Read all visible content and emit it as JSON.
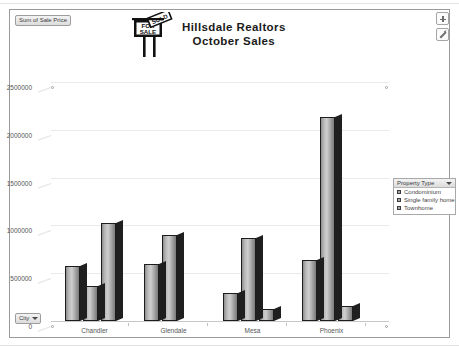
{
  "workbook": {
    "value_field_button": "Sum of Sale Price",
    "city_field_button": "City"
  },
  "chart": {
    "title_line1": "Hillsdale Realtors",
    "title_line2": "October Sales",
    "logo_for": "FOR",
    "logo_sale": "SALE",
    "logo_sold": "SOLD"
  },
  "legend": {
    "header": "Property Type",
    "items": [
      {
        "label": "Condominium",
        "color": "#a9a9a9"
      },
      {
        "label": "Single family home",
        "color": "#a9a9a9"
      },
      {
        "label": "Townhome",
        "color": "#a9a9a9"
      }
    ]
  },
  "tools": {
    "add_label": "+",
    "edit_label": "edit"
  },
  "chart_data": {
    "type": "bar",
    "title": "Hillsdale Realtors October Sales",
    "xlabel": "City",
    "ylabel": "Sum of Sale Price",
    "categories": [
      "Chandler",
      "Glendale",
      "Mesa",
      "Phoenix"
    ],
    "series": [
      {
        "name": "Condominium",
        "values": [
          575000,
          600000,
          290000,
          640000
        ]
      },
      {
        "name": "Single family home",
        "values": [
          370000,
          900000,
          870000,
          2130000
        ]
      },
      {
        "name": "Townhome",
        "values": [
          1030000,
          0,
          130000,
          160000
        ]
      }
    ],
    "ylim": [
      0,
      2500000
    ],
    "yticks": [
      0,
      500000,
      1000000,
      1500000,
      2000000,
      2500000
    ],
    "ytick_labels": [
      "0",
      "500000",
      "1000000",
      "1500000",
      "2000000",
      "2500000"
    ],
    "grid": true,
    "legend_position": "right",
    "style": "3d-clustered-column-grayscale"
  }
}
